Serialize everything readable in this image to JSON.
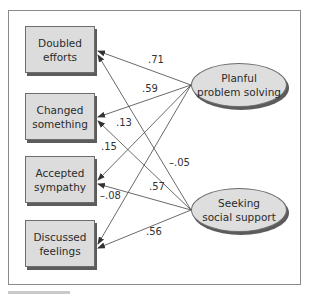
{
  "diagram": {
    "type": "path-diagram",
    "observed": [
      {
        "id": "doubled",
        "line1": "Doubled",
        "line2": "efforts"
      },
      {
        "id": "changed",
        "line1": "Changed",
        "line2": "something"
      },
      {
        "id": "accepted",
        "line1": "Accepted",
        "line2": "sympathy"
      },
      {
        "id": "discussed",
        "line1": "Discussed",
        "line2": "feelings"
      }
    ],
    "latent": [
      {
        "id": "planful",
        "line1": "Planful",
        "line2": "problem solving"
      },
      {
        "id": "seeking",
        "line1": "Seeking",
        "line2": "social support"
      }
    ],
    "paths": [
      {
        "from": "planful",
        "to": "doubled",
        "weight": ".71"
      },
      {
        "from": "planful",
        "to": "changed",
        "weight": ".59"
      },
      {
        "from": "planful",
        "to": "accepted",
        "weight": ".15"
      },
      {
        "from": "planful",
        "to": "discussed",
        "weight": "–.08"
      },
      {
        "from": "seeking",
        "to": "doubled",
        "weight": "–.05"
      },
      {
        "from": "seeking",
        "to": "changed",
        "weight": ".13"
      },
      {
        "from": "seeking",
        "to": "accepted",
        "weight": ".57"
      },
      {
        "from": "seeking",
        "to": "discussed",
        "weight": ".56"
      }
    ],
    "colors": {
      "box_fill": "#dcdcdc",
      "line": "#444444",
      "frame": "#8a8a8a"
    }
  }
}
